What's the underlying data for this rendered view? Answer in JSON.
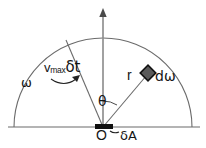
{
  "figure": {
    "type": "geometry-diagram",
    "background_color": "#ffffff",
    "stroke_color": "#4a4a4a",
    "text_color": "#151515",
    "marker_fill": "#5a5a5a",
    "marker_stroke": "#111111",
    "bar_color": "#101010",
    "width": 206,
    "height": 148
  },
  "labels": {
    "omega": "ω",
    "vmax_prefix": "v",
    "vmax_subscript": "max",
    "vmax_delta_t": "δt",
    "theta": "θ",
    "radius": "r",
    "d_omega": "dω",
    "origin": "O",
    "delta_A": "δA"
  },
  "geometry": {
    "origin": {
      "x": 103,
      "y": 127
    },
    "semicircle_radius": 89,
    "baseline": {
      "x1": 8,
      "y1": 127,
      "x2": 200,
      "y2": 127
    },
    "vertical_axis": {
      "x": 103,
      "y_top": 10,
      "y_bottom": 127
    },
    "vmax_ray": {
      "x1": 103,
      "y1": 127,
      "x2": 66,
      "y2": 40
    },
    "r_ray": {
      "x1": 103,
      "y1": 127,
      "x2": 150,
      "y2": 71
    },
    "marker_center": {
      "x": 148,
      "y": 73
    },
    "marker_size": 11,
    "area_bar": {
      "x": 95,
      "y": 124,
      "width": 18,
      "height": 5
    },
    "theta_arc_radius": 26
  }
}
